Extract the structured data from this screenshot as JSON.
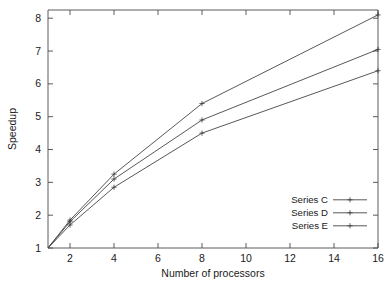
{
  "chart_data": {
    "type": "line",
    "title": "",
    "xlabel": "Number of processors",
    "ylabel": "Speedup",
    "xlim": [
      1,
      16
    ],
    "ylim": [
      1,
      8.25
    ],
    "grid": false,
    "legend_position": "bottom-right",
    "xticks": [
      "2",
      "4",
      "6",
      "8",
      "10",
      "12",
      "14",
      "16"
    ],
    "xtick_values": [
      2,
      4,
      6,
      8,
      10,
      12,
      14,
      16
    ],
    "yticks": [
      "1",
      "2",
      "3",
      "4",
      "5",
      "6",
      "7",
      "8"
    ],
    "ytick_values": [
      1,
      2,
      3,
      4,
      5,
      6,
      7,
      8
    ],
    "x": [
      1,
      2,
      4,
      8,
      16
    ],
    "series": [
      {
        "name": "Series C",
        "values": [
          1,
          1.85,
          3.25,
          5.4,
          8.1
        ],
        "marker": "plus"
      },
      {
        "name": "Series D",
        "values": [
          1,
          1.8,
          3.1,
          4.9,
          7.05
        ],
        "marker": "plus"
      },
      {
        "name": "Series E",
        "values": [
          1,
          1.7,
          2.85,
          4.5,
          6.4
        ],
        "marker": "plus"
      }
    ]
  },
  "legend": {
    "entries": [
      {
        "label": "Series C"
      },
      {
        "label": "Series D"
      },
      {
        "label": "Series E"
      }
    ]
  },
  "axes": {
    "x_title": "Number of processors",
    "y_title": "Speedup"
  },
  "colors": {
    "line": "#3a3a3a",
    "axis": "#4a4a4a",
    "text": "#1a1a1a",
    "background": "#ffffff"
  }
}
